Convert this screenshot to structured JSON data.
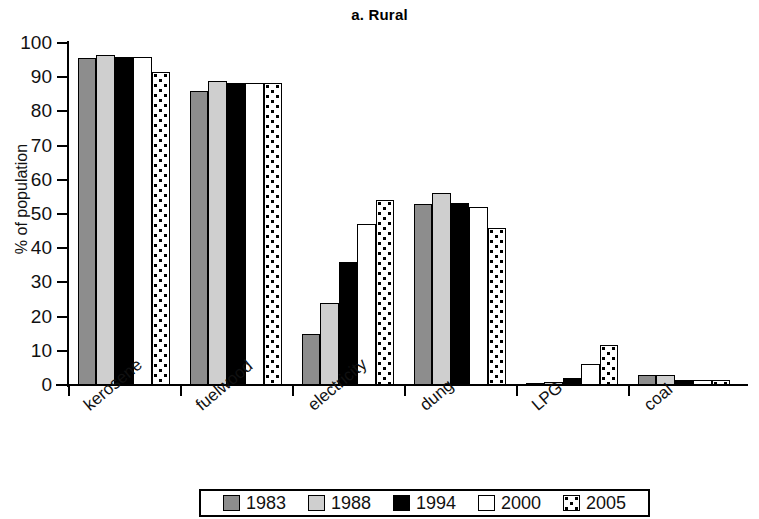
{
  "chart_data": {
    "type": "bar",
    "title": "a. Rural",
    "xlabel": "",
    "ylabel": "% of population",
    "ylim": [
      0,
      100
    ],
    "yticks": [
      0,
      10,
      20,
      30,
      40,
      50,
      60,
      70,
      80,
      90,
      100
    ],
    "ytick_labels": [
      "0",
      "10",
      "20",
      "30",
      "40",
      "50",
      "60",
      "70",
      "80",
      "90",
      "100"
    ],
    "grid": false,
    "legend_position": "bottom",
    "categories": [
      "kerosene",
      "fuelwood",
      "electricity",
      "dung",
      "LPG",
      "coal"
    ],
    "series": [
      {
        "name": "1983",
        "color": "#8d8d8d",
        "pattern": "solid-gray",
        "values": [
          95.5,
          86.0,
          15.0,
          53.0,
          0.4,
          3.0
        ]
      },
      {
        "name": "1988",
        "color": "#cfcfcf",
        "pattern": "solid-light-gray",
        "values": [
          96.5,
          89.0,
          24.0,
          56.0,
          1.0,
          3.0
        ]
      },
      {
        "name": "1994",
        "color": "#000000",
        "pattern": "solid-black",
        "values": [
          96.0,
          88.3,
          36.0,
          53.2,
          2.0,
          1.6
        ]
      },
      {
        "name": "2000",
        "color": "#ffffff",
        "pattern": "solid-white",
        "values": [
          96.0,
          88.3,
          47.0,
          52.0,
          6.0,
          1.6
        ]
      },
      {
        "name": "2005",
        "color": "#ffffff",
        "pattern": "checkered",
        "values": [
          91.5,
          88.3,
          54.0,
          46.0,
          11.8,
          1.6
        ]
      }
    ]
  },
  "legend": {
    "items": [
      {
        "label": "1983"
      },
      {
        "label": "1988"
      },
      {
        "label": "1994"
      },
      {
        "label": "2000"
      },
      {
        "label": "2005"
      }
    ]
  }
}
